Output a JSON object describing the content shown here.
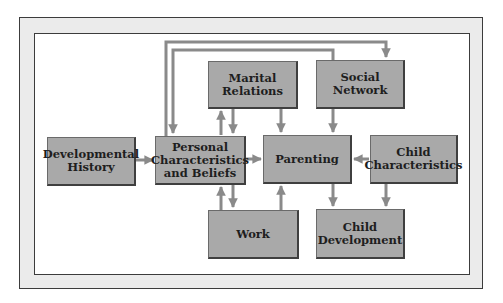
{
  "diagram": {
    "nodes": [
      {
        "id": "developmental-history",
        "label": "Developmental\nHistory"
      },
      {
        "id": "personal-characteristics",
        "label": "Personal\nCharacteristics\nand Beliefs"
      },
      {
        "id": "marital-relations",
        "label": "Marital\nRelations"
      },
      {
        "id": "social-network",
        "label": "Social\nNetwork"
      },
      {
        "id": "parenting",
        "label": "Parenting"
      },
      {
        "id": "child-characteristics",
        "label": "Child\nCharacteristics"
      },
      {
        "id": "work",
        "label": "Work"
      },
      {
        "id": "child-development",
        "label": "Child\nDevelopment"
      }
    ],
    "edges": [
      {
        "from": "developmental-history",
        "to": "personal-characteristics"
      },
      {
        "from": "personal-characteristics",
        "to": "parenting"
      },
      {
        "from": "personal-characteristics",
        "to": "marital-relations"
      },
      {
        "from": "marital-relations",
        "to": "personal-characteristics"
      },
      {
        "from": "personal-characteristics",
        "to": "work"
      },
      {
        "from": "work",
        "to": "personal-characteristics"
      },
      {
        "from": "personal-characteristics",
        "to": "social-network"
      },
      {
        "from": "social-network",
        "to": "personal-characteristics"
      },
      {
        "from": "marital-relations",
        "to": "parenting"
      },
      {
        "from": "social-network",
        "to": "parenting"
      },
      {
        "from": "work",
        "to": "parenting"
      },
      {
        "from": "child-characteristics",
        "to": "parenting"
      },
      {
        "from": "parenting",
        "to": "child-development"
      },
      {
        "from": "child-characteristics",
        "to": "child-development"
      }
    ]
  },
  "colors": {
    "box_fill": "#a9a9a9",
    "arrow": "#8a8a8a",
    "frame_fill": "#ebebeb",
    "border": "#3c3c3c"
  }
}
